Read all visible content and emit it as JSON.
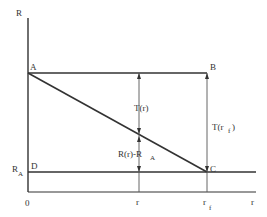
{
  "diagram": {
    "type": "geometric-relation",
    "axes": {
      "y_label": "R",
      "x_label": "r",
      "origin_label": "0"
    },
    "points": {
      "A": "A",
      "B": "B",
      "C": "C",
      "D": "D"
    },
    "y_ticks": {
      "RA_main": "R",
      "RA_sub": "A"
    },
    "x_ticks": {
      "r": "r",
      "rf_main": "r",
      "rf_sub": "f"
    },
    "annotations": {
      "T_r": "T(r)",
      "T_rf_main": "T(r",
      "T_rf_sub": "f",
      "T_rf_close": ")",
      "R_minus_RA_main": "R(r)-R",
      "R_minus_RA_sub": "A"
    },
    "colors": {
      "ink": "#333333",
      "background": "#ffffff"
    }
  }
}
